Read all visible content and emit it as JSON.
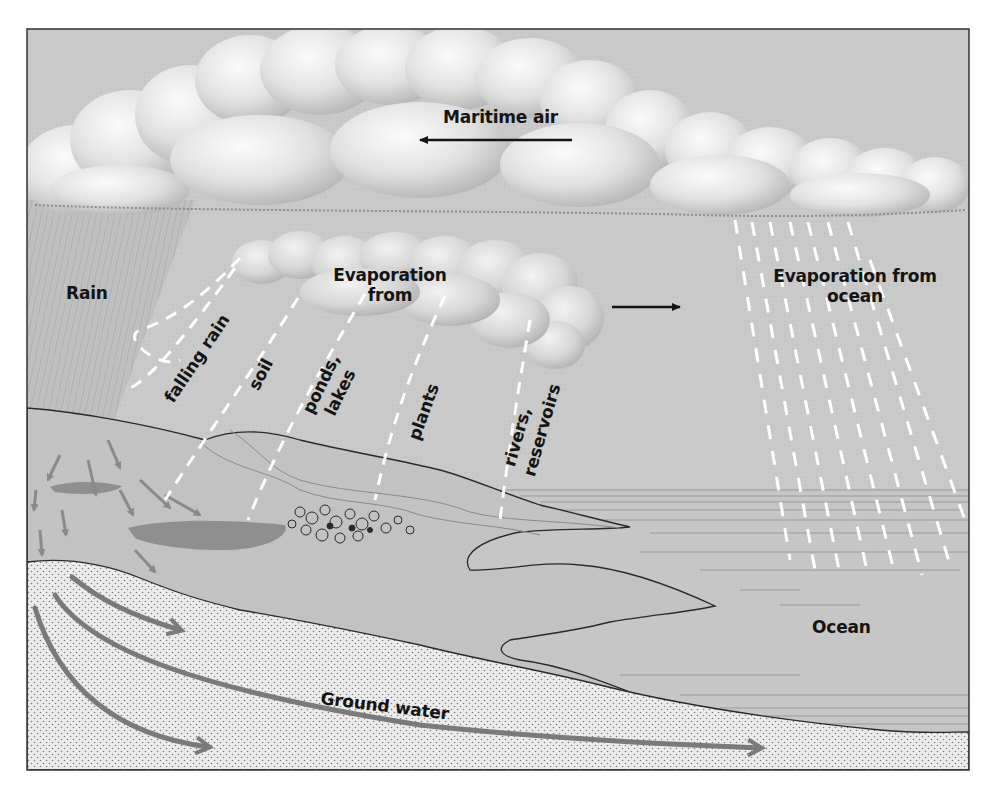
{
  "diagram": {
    "colors": {
      "page_background": "#ffffff",
      "sky": "#c9c9c9",
      "cloud_fill": "#e4e4e4",
      "cloud_highlight": "#fbfbfb",
      "cloud_shadow": "#8c8c8c",
      "land": "#c2c2c2",
      "ocean": "#c6c6c6",
      "ground_water": "#ececec",
      "stipple": "#7d7d7d",
      "lake": "#8f8f8f",
      "arrow_gray": "#7a7a7a",
      "frame": "#333333",
      "text": "#141414",
      "evaporation_dash": "#ffffff"
    },
    "labels": {
      "maritime_air": "Maritime air",
      "rain": "Rain",
      "evaporation_from_line1": "Evaporation",
      "evaporation_from_line2": "from",
      "falling_rain": "falling rain",
      "soil": "soil",
      "ponds": "ponds,",
      "lakes": "lakes",
      "plants": "plants",
      "rivers": "rivers,",
      "reservoirs": "reservoirs",
      "evaporation_ocean_line1": "Evaporation from",
      "evaporation_ocean_line2": "ocean",
      "ocean": "Ocean",
      "ground_water": "Ground water"
    },
    "arrows": {
      "maritime_air_direction": "left",
      "inland_cloud_direction": "right",
      "ground_water_flow_direction": "right"
    },
    "evaporation_sources": [
      "falling rain",
      "soil",
      "ponds, lakes",
      "plants",
      "rivers, reservoirs"
    ]
  }
}
